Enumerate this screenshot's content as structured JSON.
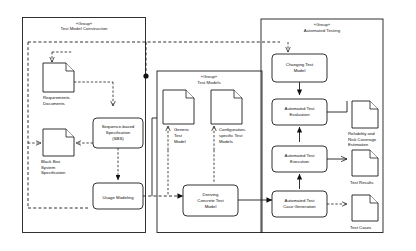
{
  "diagram": {
    "type": "uml-activity-group-diagram",
    "stereotype": "«Group»",
    "groups": [
      {
        "id": "test-model-construction",
        "stereotype": "«Group»",
        "title": "Test Model Construction"
      },
      {
        "id": "test-models",
        "stereotype": "«Group»",
        "title": "Test Models"
      },
      {
        "id": "automated-testing",
        "stereotype": "«Group»",
        "title": "Automated Testing"
      }
    ],
    "artifacts": [
      {
        "id": "requirements-documents",
        "label_lines": [
          "Requirements",
          "Documents"
        ]
      },
      {
        "id": "black-box-system-specification",
        "label_lines": [
          "Black Box",
          "System",
          "Specification"
        ]
      },
      {
        "id": "generic-test-model",
        "label_lines": [
          "Generic",
          "Test",
          "Model"
        ]
      },
      {
        "id": "configuration-specific-test-models",
        "label_lines": [
          "Configuration-",
          "specific Test",
          "Models"
        ]
      },
      {
        "id": "reliability-risk-coverage-estimation",
        "label_lines": [
          "Reliability and",
          "Risk Coverage",
          "Estimation"
        ]
      },
      {
        "id": "test-results",
        "label_lines": [
          "Test Results"
        ]
      },
      {
        "id": "test-cases",
        "label_lines": [
          "Test Cases"
        ]
      }
    ],
    "activities": [
      {
        "id": "sequence-based-specification",
        "label_lines": [
          "Sequence-based",
          "Specification",
          "(SBS)"
        ]
      },
      {
        "id": "usage-modeling",
        "label_lines": [
          "Usage Modeling"
        ]
      },
      {
        "id": "deriving-concrete-test-model",
        "label_lines": [
          "Deriving",
          "Concrete Test",
          "Model"
        ]
      },
      {
        "id": "changing-test-model",
        "label_lines": [
          "Changing Test",
          "Model"
        ]
      },
      {
        "id": "automated-test-evaluation",
        "label_lines": [
          "Automated Test",
          "Evaluation"
        ]
      },
      {
        "id": "automated-test-execution",
        "label_lines": [
          "Automated Test",
          "Execution"
        ]
      },
      {
        "id": "automated-test-case-generation",
        "label_lines": [
          "Automated Test",
          "Case Generation"
        ]
      }
    ],
    "colors": {
      "stroke": "#1c1c1c",
      "background": "#ffffff",
      "text": "#0d0d0d"
    }
  }
}
